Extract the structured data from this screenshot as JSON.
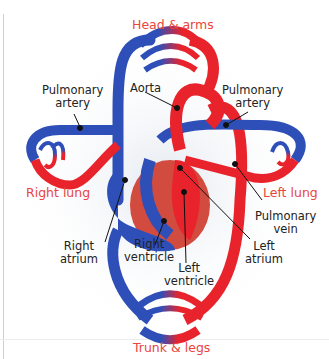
{
  "diagram": {
    "type": "double circulation",
    "colors": {
      "oxygenated": "#e8232c",
      "deoxygenated": "#2f4fb8",
      "region_label": "#e8453c",
      "label": "#222222"
    },
    "regions": {
      "top": "Head & arms",
      "right_lung": "Right lung",
      "left_lung": "Left lung",
      "bottom": "Trunk & legs"
    },
    "labels": {
      "pulm_artery_left": [
        "Pulmonary",
        "artery"
      ],
      "aorta": "Aorta",
      "pulm_artery_right": [
        "Pulmonary",
        "artery"
      ],
      "pulm_vein": [
        "Pulmonary",
        "vein"
      ],
      "right_atrium": [
        "Right",
        "atrium"
      ],
      "right_ventricle": [
        "Right",
        "ventricle"
      ],
      "left_ventricle": [
        "Left",
        "ventricle"
      ],
      "left_atrium": [
        "Left",
        "atrium"
      ]
    }
  }
}
